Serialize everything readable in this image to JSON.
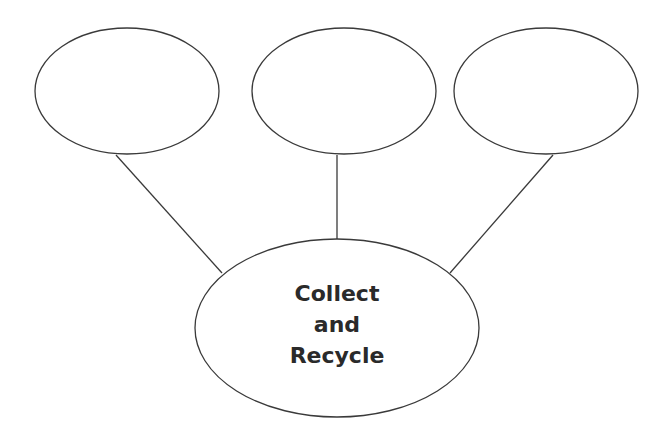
{
  "diagram": {
    "type": "web-organizer",
    "center": {
      "lines": [
        "Collect",
        "and",
        "Recycle"
      ]
    },
    "outer_nodes": [
      {
        "label": ""
      },
      {
        "label": ""
      },
      {
        "label": ""
      }
    ],
    "colors": {
      "stroke": "#3a3a3a",
      "text": "#2a2a2a",
      "background": "#ffffff"
    }
  }
}
